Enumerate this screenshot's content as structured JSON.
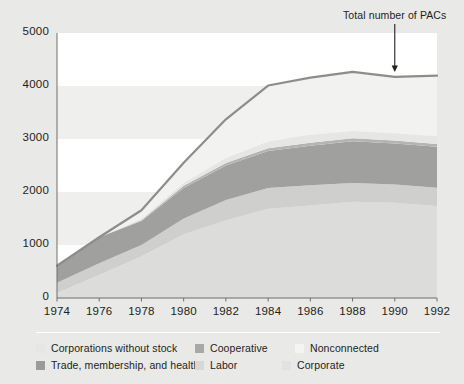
{
  "chart_data": {
    "type": "area",
    "stacked": true,
    "title": "",
    "xlabel": "",
    "ylabel": "",
    "x": [
      1974,
      1976,
      1978,
      1980,
      1982,
      1984,
      1986,
      1988,
      1990,
      1992
    ],
    "categories": [
      "1974",
      "1976",
      "1978",
      "1980",
      "1982",
      "1984",
      "1986",
      "1988",
      "1990",
      "1992"
    ],
    "xlim": [
      1974,
      1992
    ],
    "ylim": [
      0,
      5000
    ],
    "yticks": [
      0,
      1000,
      2000,
      3000,
      4000,
      5000
    ],
    "ytick_labels": [
      "0",
      "1000",
      "2000",
      "3000",
      "4000",
      "5000"
    ],
    "grid": "horizontal-bands",
    "legend_position": "bottom",
    "series": [
      {
        "name": "Corporate",
        "color": "#dcdcda",
        "values": [
          89,
          433,
          785,
          1204,
          1469,
          1682,
          1744,
          1816,
          1795,
          1735
        ]
      },
      {
        "name": "Labor",
        "color": "#cfcfcd",
        "values": [
          201,
          224,
          217,
          297,
          380,
          394,
          384,
          354,
          346,
          347
        ]
      },
      {
        "name": "Trade, membership, and health",
        "color": "#a0a09e",
        "values": [
          318,
          489,
          453,
          574,
          649,
          698,
          745,
          786,
          774,
          770
        ]
      },
      {
        "name": "Cooperative",
        "color": "#b4b4b2",
        "values": [
          0,
          0,
          12,
          42,
          47,
          52,
          56,
          59,
          59,
          56
        ]
      },
      {
        "name": "Corporations without stock",
        "color": "#e6e6e4",
        "values": [
          0,
          0,
          24,
          56,
          103,
          130,
          151,
          138,
          136,
          142
        ]
      },
      {
        "name": "Nonconnected",
        "color": "#f2f2f0",
        "values": [
          0,
          0,
          165,
          378,
          723,
          1053,
          1077,
          1115,
          1062,
          1145
        ]
      }
    ],
    "total_line": {
      "label": "Total number of PACs",
      "color": "#8d8d8b",
      "values": [
        608,
        1146,
        1656,
        2551,
        3371,
        4009,
        4157,
        4268,
        4172,
        4195
      ]
    },
    "annotation": {
      "text": "Total number of PACs",
      "arrow": "down-arrow",
      "at_x": 1990
    }
  },
  "legend": {
    "row1": [
      {
        "label": "Corporations without stock",
        "color": "#e6e6e4"
      },
      {
        "label": "Cooperative",
        "color": "#a8a8a6"
      },
      {
        "label": "Nonconnected",
        "color": "#f4f4f2"
      }
    ],
    "row2": [
      {
        "label": "Trade, membership, and health",
        "color": "#9b9b99"
      },
      {
        "label": "Labor",
        "color": "#d8d8d6"
      },
      {
        "label": "Corporate",
        "color": "#e2e2e0"
      }
    ]
  },
  "colors": {
    "background": "#e9e9e7",
    "panel": "#ffffff",
    "band": "#efefed",
    "text": "#231f20",
    "axis": "#6f6f6d"
  }
}
